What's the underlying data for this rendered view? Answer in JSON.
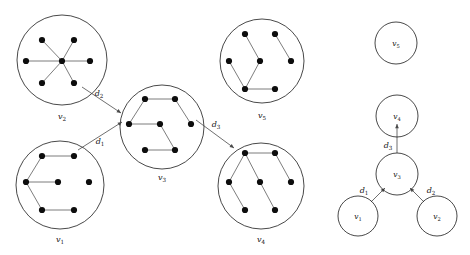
{
  "figure": {
    "background_color": "#ffffff",
    "node_color": "#0d0d0d",
    "circle_stroke_color": "#1a1a1a",
    "edge_color": "#6e6e6e",
    "arrow_color": "#4a4a4a"
  },
  "clusters": [
    {
      "id": "v2",
      "label_main": "v",
      "label_sub": "2",
      "center": [
        62,
        60
      ],
      "radius": 45,
      "label_pos": [
        62,
        119
      ],
      "graph_type": "wheel",
      "nodes": [
        [
          42,
          40
        ],
        [
          74,
          40
        ],
        [
          26,
          61
        ],
        [
          62,
          61
        ],
        [
          90,
          61
        ],
        [
          42,
          83
        ],
        [
          74,
          83
        ]
      ],
      "edges": [
        [
          0,
          3
        ],
        [
          1,
          3
        ],
        [
          2,
          3
        ],
        [
          3,
          4
        ],
        [
          3,
          5
        ],
        [
          3,
          6
        ]
      ]
    },
    {
      "id": "v1",
      "label_main": "v",
      "label_sub": "1",
      "center": [
        60,
        185
      ],
      "radius": 44,
      "label_pos": [
        60,
        242
      ],
      "graph_type": "hexagon",
      "nodes": [
        [
          42,
          156
        ],
        [
          74,
          156
        ],
        [
          26,
          182
        ],
        [
          58,
          182
        ],
        [
          89,
          182
        ],
        [
          42,
          210
        ],
        [
          74,
          210
        ]
      ],
      "edges": [
        [
          0,
          1
        ],
        [
          2,
          0
        ],
        [
          2,
          3
        ],
        [
          2,
          5
        ],
        [
          5,
          6
        ]
      ]
    },
    {
      "id": "v3",
      "label_main": "v",
      "label_sub": "3",
      "center": [
        162,
        127
      ],
      "radius": 42,
      "label_pos": [
        162,
        180
      ],
      "graph_type": "hexagon",
      "nodes": [
        [
          145,
          99
        ],
        [
          175,
          99
        ],
        [
          129,
          124
        ],
        [
          160,
          124
        ],
        [
          191,
          124
        ],
        [
          145,
          150
        ],
        [
          175,
          150
        ]
      ],
      "edges": [
        [
          0,
          1
        ],
        [
          0,
          2
        ],
        [
          1,
          4
        ],
        [
          2,
          3
        ],
        [
          3,
          6
        ],
        [
          5,
          6
        ]
      ]
    },
    {
      "id": "v5",
      "label_main": "v",
      "label_sub": "5",
      "center": [
        262,
        61
      ],
      "radius": 42,
      "label_pos": [
        262,
        118
      ],
      "graph_type": "hexagon",
      "nodes": [
        [
          245,
          34
        ],
        [
          275,
          34
        ],
        [
          229,
          61
        ],
        [
          260,
          61
        ],
        [
          291,
          61
        ],
        [
          245,
          89
        ],
        [
          275,
          89
        ]
      ],
      "edges": [
        [
          0,
          3
        ],
        [
          1,
          4
        ],
        [
          2,
          5
        ],
        [
          3,
          5
        ],
        [
          5,
          6
        ]
      ]
    },
    {
      "id": "v4",
      "label_main": "v",
      "label_sub": "4",
      "center": [
        261,
        186
      ],
      "radius": 43,
      "label_pos": [
        261,
        242
      ],
      "graph_type": "hexagon",
      "nodes": [
        [
          245,
          153
        ],
        [
          275,
          153
        ],
        [
          229,
          182
        ],
        [
          260,
          182
        ],
        [
          291,
          182
        ],
        [
          245,
          210
        ],
        [
          275,
          210
        ]
      ],
      "edges": [
        [
          0,
          1
        ],
        [
          0,
          2
        ],
        [
          0,
          3
        ],
        [
          1,
          4
        ],
        [
          3,
          6
        ],
        [
          2,
          5
        ]
      ]
    }
  ],
  "distance_arrows": [
    {
      "id": "d2",
      "label_main": "d",
      "label_sub": "2",
      "from_cluster": "v2",
      "to_cluster": "v3",
      "start": [
        82,
        87
      ],
      "end": [
        121,
        113
      ],
      "label_pos": [
        99,
        96
      ]
    },
    {
      "id": "d1",
      "label_main": "d",
      "label_sub": "1",
      "from_cluster": "v1",
      "to_cluster": "v3",
      "start": [
        78,
        150
      ],
      "end": [
        122,
        122
      ],
      "label_pos": [
        100,
        144
      ]
    },
    {
      "id": "d3",
      "label_main": "d",
      "label_sub": "3",
      "from_cluster": "v3",
      "to_cluster": "v4",
      "start": [
        196,
        120
      ],
      "end": [
        234,
        148
      ],
      "label_pos": [
        216,
        127
      ]
    }
  ],
  "tree": {
    "nodes": [
      {
        "id": "v5",
        "label_main": "v",
        "label_sub": "5",
        "center": [
          396,
          43
        ],
        "radius": 21,
        "isolated": true
      },
      {
        "id": "v4",
        "label_main": "v",
        "label_sub": "4",
        "center": [
          397,
          116
        ],
        "radius": 21,
        "isolated": false
      },
      {
        "id": "v3",
        "label_main": "v",
        "label_sub": "3",
        "center": [
          397,
          174
        ],
        "radius": 21,
        "isolated": false
      },
      {
        "id": "v1",
        "label_main": "v",
        "label_sub": "1",
        "center": [
          358,
          216
        ],
        "radius": 20,
        "isolated": false
      },
      {
        "id": "v2",
        "label_main": "v",
        "label_sub": "2",
        "center": [
          437,
          216
        ],
        "radius": 20,
        "isolated": false
      }
    ],
    "edges": [
      {
        "id": "d3",
        "label_main": "d",
        "label_sub": "3",
        "from": "v3",
        "to": "v4",
        "start": [
          397,
          153
        ],
        "end": [
          397,
          124
        ],
        "label_pos": [
          388,
          148
        ]
      },
      {
        "id": "d1",
        "label_main": "d",
        "label_sub": "1",
        "from": "v1",
        "to": "v3",
        "start": [
          371,
          202
        ],
        "end": [
          385,
          188
        ],
        "label_pos": [
          364,
          193
        ]
      },
      {
        "id": "d2",
        "label_main": "d",
        "label_sub": "2",
        "from": "v2",
        "to": "v3",
        "start": [
          424,
          202
        ],
        "end": [
          410,
          188
        ],
        "label_pos": [
          431,
          193
        ]
      }
    ]
  }
}
